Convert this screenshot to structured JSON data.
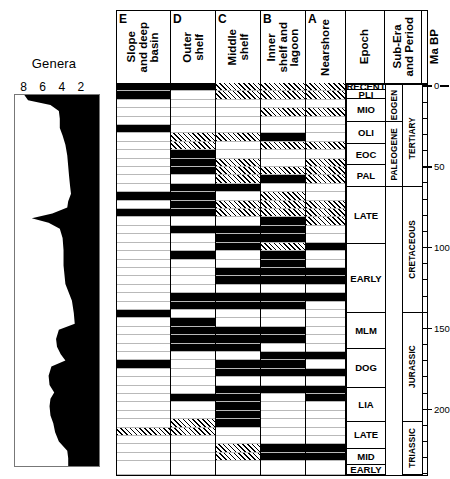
{
  "genera": {
    "title": "Genera",
    "axis_ticks": [
      8,
      6,
      4,
      2
    ],
    "axis_max": 9,
    "axis_direction": "right-to-left"
  },
  "facies_columns": [
    {
      "letter": "E",
      "label": "Slope\nand deep\nbasin"
    },
    {
      "letter": "D",
      "label": "Outer\nshelf"
    },
    {
      "letter": "C",
      "label": "Middle\nshelf"
    },
    {
      "letter": "B",
      "label": "Inner\nshelf and\nlagoon"
    },
    {
      "letter": "A",
      "label": "Nearshore"
    }
  ],
  "meta_columns": [
    {
      "key": "epoch",
      "label": "Epoch"
    },
    {
      "key": "subera",
      "label": "Sub-Era\nand Period"
    },
    {
      "key": "mabp",
      "label": "Ma BP"
    }
  ],
  "epochs": [
    {
      "label": "RECENT",
      "top_ma": -1.5,
      "bottom_ma": 3.0
    },
    {
      "label": "PLI",
      "top_ma": 3.0,
      "bottom_ma": 8.5
    },
    {
      "label": "MIO",
      "top_ma": 8.5,
      "bottom_ma": 22.5
    },
    {
      "label": "OLI",
      "top_ma": 22.5,
      "bottom_ma": 36.0
    },
    {
      "label": "EOC",
      "top_ma": 36.0,
      "bottom_ma": 49.5
    },
    {
      "label": "PAL",
      "top_ma": 49.5,
      "bottom_ma": 63.0
    },
    {
      "label": "LATE",
      "top_ma": 63.0,
      "bottom_ma": 98.0
    },
    {
      "label": "EARLY",
      "top_ma": 98.0,
      "bottom_ma": 141.0
    },
    {
      "label": "MLM",
      "top_ma": 141.0,
      "bottom_ma": 163.0
    },
    {
      "label": "DOG",
      "top_ma": 163.0,
      "bottom_ma": 187.0
    },
    {
      "label": "LIA",
      "top_ma": 187.0,
      "bottom_ma": 208.0
    },
    {
      "label": "LATE",
      "top_ma": 208.0,
      "bottom_ma": 225.0
    },
    {
      "label": "MID",
      "top_ma": 225.0,
      "bottom_ma": 235.0
    },
    {
      "label": "EARLY",
      "top_ma": 235.0,
      "bottom_ma": 241.0
    }
  ],
  "suberas": [
    {
      "label": "NEOGENE",
      "top_ma": 3.0,
      "bottom_ma": 22.5
    },
    {
      "label": "PALEOGENE",
      "top_ma": 22.5,
      "bottom_ma": 63.0
    }
  ],
  "periods": [
    {
      "label": "TERTIARY",
      "top_ma": 3.0,
      "bottom_ma": 63.0
    },
    {
      "label": "CRETACEOUS",
      "top_ma": 63.0,
      "bottom_ma": 141.0
    },
    {
      "label": "JURASSIC",
      "top_ma": 141.0,
      "bottom_ma": 208.0
    },
    {
      "label": "TRIASSIC",
      "top_ma": 208.0,
      "bottom_ma": 241.0
    }
  ],
  "scale": {
    "label": "Ma BP",
    "major_labels": [
      "0",
      "50",
      "100",
      "150",
      "200"
    ],
    "major_values": [
      0,
      50,
      100,
      150,
      200
    ],
    "minor_interval": 10,
    "range": [
      -1.5,
      241
    ]
  },
  "chart_data": {
    "type": "table",
    "xlabel": "Genera",
    "ylabel": "Ma BP",
    "ylim": [
      241,
      -1.5
    ],
    "xlim": [
      9,
      0
    ],
    "grid": true,
    "legend": [
      "black = abundant",
      "hatched = present",
      "white = absent"
    ],
    "series": [
      {
        "name": "Genera",
        "type": "area",
        "note": "Silhouette plotted right-to-left; value read against top axis 8/6/4/2",
        "points": [
          {
            "ma": -1.5,
            "genera": 8.0
          },
          {
            "ma": 2,
            "genera": 7.6
          },
          {
            "ma": 5,
            "genera": 5.2
          },
          {
            "ma": 9,
            "genera": 4.3
          },
          {
            "ma": 14,
            "genera": 4.2
          },
          {
            "ma": 20,
            "genera": 4.2
          },
          {
            "ma": 25,
            "genera": 3.9
          },
          {
            "ma": 31,
            "genera": 3.6
          },
          {
            "ma": 38,
            "genera": 3.4
          },
          {
            "ma": 45,
            "genera": 3.3
          },
          {
            "ma": 52,
            "genera": 3.2
          },
          {
            "ma": 58,
            "genera": 3.1
          },
          {
            "ma": 63,
            "genera": 3.0
          },
          {
            "ma": 68,
            "genera": 3.3
          },
          {
            "ma": 72,
            "genera": 3.4
          },
          {
            "ma": 76,
            "genera": 5.0
          },
          {
            "ma": 79,
            "genera": 7.2
          },
          {
            "ma": 82,
            "genera": 5.4
          },
          {
            "ma": 86,
            "genera": 4.2
          },
          {
            "ma": 92,
            "genera": 3.9
          },
          {
            "ma": 100,
            "genera": 3.8
          },
          {
            "ma": 110,
            "genera": 3.8
          },
          {
            "ma": 122,
            "genera": 3.6
          },
          {
            "ma": 133,
            "genera": 2.9
          },
          {
            "ma": 141,
            "genera": 2.7
          },
          {
            "ma": 148,
            "genera": 2.6
          },
          {
            "ma": 152,
            "genera": 4.3
          },
          {
            "ma": 158,
            "genera": 4.6
          },
          {
            "ma": 163,
            "genera": 4.5
          },
          {
            "ma": 168,
            "genera": 4.1
          },
          {
            "ma": 172,
            "genera": 3.6
          },
          {
            "ma": 176,
            "genera": 5.1
          },
          {
            "ma": 182,
            "genera": 5.4
          },
          {
            "ma": 188,
            "genera": 5.3
          },
          {
            "ma": 193,
            "genera": 4.8
          },
          {
            "ma": 197,
            "genera": 5.2
          },
          {
            "ma": 202,
            "genera": 5.3
          },
          {
            "ma": 208,
            "genera": 5.2
          },
          {
            "ma": 213,
            "genera": 4.9
          },
          {
            "ma": 219,
            "genera": 4.7
          },
          {
            "ma": 225,
            "genera": 4.3
          },
          {
            "ma": 231,
            "genera": 3.4
          },
          {
            "ma": 236,
            "genera": 3.3
          },
          {
            "ma": 241,
            "genera": 3.3
          }
        ]
      }
    ],
    "facies_matrix": {
      "row_height_ma": 5.2,
      "columns": [
        "E",
        "D",
        "C",
        "B",
        "A"
      ],
      "fill_codes": {
        "b": "black",
        "h": "hatched",
        "w": "white"
      },
      "rows": [
        {
          "top_ma": -1.5,
          "cells": [
            "b",
            "b",
            "h",
            "h",
            "h"
          ]
        },
        {
          "top_ma": 3.7,
          "cells": [
            "b",
            "w",
            "h",
            "h",
            "h"
          ]
        },
        {
          "top_ma": 8.9,
          "cells": [
            "w",
            "w",
            "w",
            "w",
            "w"
          ]
        },
        {
          "top_ma": 14.1,
          "cells": [
            "w",
            "w",
            "w",
            "h",
            "h"
          ]
        },
        {
          "top_ma": 19.3,
          "cells": [
            "w",
            "w",
            "w",
            "w",
            "w"
          ]
        },
        {
          "top_ma": 24.5,
          "cells": [
            "b",
            "w",
            "w",
            "w",
            "w"
          ]
        },
        {
          "top_ma": 29.7,
          "cells": [
            "w",
            "h",
            "h",
            "b",
            "w"
          ]
        },
        {
          "top_ma": 34.9,
          "cells": [
            "w",
            "h",
            "w",
            "h",
            "h"
          ]
        },
        {
          "top_ma": 40.1,
          "cells": [
            "w",
            "b",
            "w",
            "w",
            "w"
          ]
        },
        {
          "top_ma": 45.3,
          "cells": [
            "w",
            "b",
            "h",
            "w",
            "h"
          ]
        },
        {
          "top_ma": 50.5,
          "cells": [
            "w",
            "b",
            "h",
            "h",
            "h"
          ]
        },
        {
          "top_ma": 55.7,
          "cells": [
            "w",
            "w",
            "h",
            "b",
            "h"
          ]
        },
        {
          "top_ma": 60.9,
          "cells": [
            "w",
            "b",
            "b",
            "w",
            "w"
          ]
        },
        {
          "top_ma": 66.1,
          "cells": [
            "b",
            "b",
            "w",
            "h",
            "w"
          ]
        },
        {
          "top_ma": 71.3,
          "cells": [
            "w",
            "b",
            "h",
            "h",
            "h"
          ]
        },
        {
          "top_ma": 76.5,
          "cells": [
            "b",
            "b",
            "h",
            "h",
            "h"
          ]
        },
        {
          "top_ma": 81.7,
          "cells": [
            "w",
            "w",
            "w",
            "b",
            "h"
          ]
        },
        {
          "top_ma": 86.9,
          "cells": [
            "w",
            "b",
            "b",
            "b",
            "w"
          ]
        },
        {
          "top_ma": 92.1,
          "cells": [
            "w",
            "w",
            "b",
            "b",
            "w"
          ]
        },
        {
          "top_ma": 97.3,
          "cells": [
            "w",
            "w",
            "b",
            "h",
            "b"
          ]
        },
        {
          "top_ma": 102.5,
          "cells": [
            "w",
            "b",
            "w",
            "b",
            "w"
          ]
        },
        {
          "top_ma": 107.7,
          "cells": [
            "w",
            "w",
            "w",
            "b",
            "w"
          ]
        },
        {
          "top_ma": 112.9,
          "cells": [
            "w",
            "w",
            "b",
            "b",
            "b"
          ]
        },
        {
          "top_ma": 118.1,
          "cells": [
            "w",
            "w",
            "b",
            "b",
            "b"
          ]
        },
        {
          "top_ma": 123.3,
          "cells": [
            "w",
            "w",
            "w",
            "w",
            "w"
          ]
        },
        {
          "top_ma": 128.5,
          "cells": [
            "w",
            "b",
            "b",
            "b",
            "b"
          ]
        },
        {
          "top_ma": 133.7,
          "cells": [
            "w",
            "b",
            "b",
            "b",
            "w"
          ]
        },
        {
          "top_ma": 138.9,
          "cells": [
            "b",
            "w",
            "w",
            "w",
            "w"
          ]
        },
        {
          "top_ma": 144.1,
          "cells": [
            "w",
            "b",
            "w",
            "w",
            "w"
          ]
        },
        {
          "top_ma": 149.3,
          "cells": [
            "w",
            "b",
            "b",
            "b",
            "w"
          ]
        },
        {
          "top_ma": 154.5,
          "cells": [
            "w",
            "b",
            "b",
            "b",
            "w"
          ]
        },
        {
          "top_ma": 159.7,
          "cells": [
            "w",
            "b",
            "b",
            "w",
            "w"
          ]
        },
        {
          "top_ma": 164.9,
          "cells": [
            "w",
            "w",
            "w",
            "b",
            "b"
          ]
        },
        {
          "top_ma": 170.1,
          "cells": [
            "b",
            "w",
            "b",
            "b",
            "w"
          ]
        },
        {
          "top_ma": 175.3,
          "cells": [
            "w",
            "w",
            "b",
            "b",
            "b"
          ]
        },
        {
          "top_ma": 180.5,
          "cells": [
            "w",
            "w",
            "w",
            "w",
            "w"
          ]
        },
        {
          "top_ma": 185.7,
          "cells": [
            "w",
            "w",
            "b",
            "b",
            "b"
          ]
        },
        {
          "top_ma": 190.9,
          "cells": [
            "w",
            "b",
            "b",
            "w",
            "b"
          ]
        },
        {
          "top_ma": 196.1,
          "cells": [
            "w",
            "w",
            "b",
            "w",
            "w"
          ]
        },
        {
          "top_ma": 201.3,
          "cells": [
            "w",
            "w",
            "b",
            "w",
            "w"
          ]
        },
        {
          "top_ma": 206.5,
          "cells": [
            "w",
            "h",
            "b",
            "w",
            "w"
          ]
        },
        {
          "top_ma": 211.7,
          "cells": [
            "h",
            "h",
            "w",
            "w",
            "w"
          ]
        },
        {
          "top_ma": 216.9,
          "cells": [
            "w",
            "w",
            "w",
            "w",
            "w"
          ]
        },
        {
          "top_ma": 222.1,
          "cells": [
            "w",
            "w",
            "h",
            "b",
            "b"
          ]
        },
        {
          "top_ma": 227.3,
          "cells": [
            "w",
            "w",
            "h",
            "b",
            "b"
          ]
        },
        {
          "top_ma": 232.5,
          "cells": [
            "w",
            "w",
            "w",
            "w",
            "w"
          ]
        }
      ]
    }
  }
}
